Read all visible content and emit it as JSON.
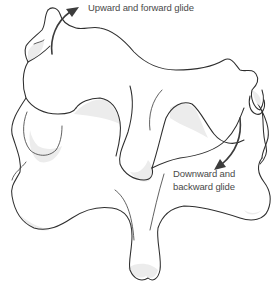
{
  "diagram": {
    "style": "black line art on white",
    "colors": {
      "outline": "#2e2e2e",
      "shading": "#ececec",
      "text": "#4a4a4a",
      "background": "#ffffff"
    },
    "annotations": [
      {
        "id": "upward",
        "text": "Upward and forward glide",
        "arrow": "curved arrow pointing up-right near top-left facet of upper vertebra"
      },
      {
        "id": "downward",
        "lines": [
          "Downward and",
          "backward glide"
        ],
        "arrow": "curved arrow pointing down-left near right facet of upper vertebra"
      }
    ]
  }
}
